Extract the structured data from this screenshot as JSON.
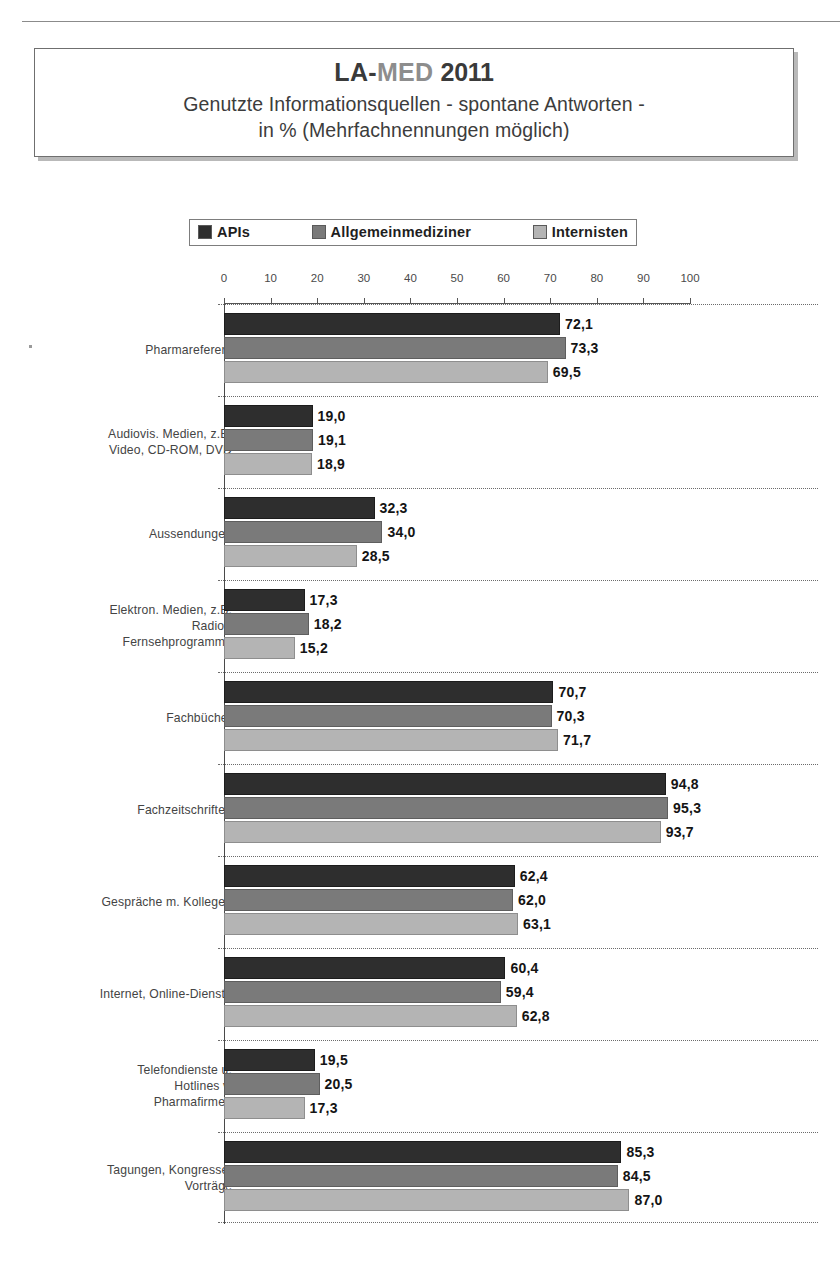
{
  "header": {
    "logo_la": "LA-",
    "logo_med": "MED",
    "logo_year": "2011",
    "title_line1": "Genutzte Informationsquellen - spontane Antworten -",
    "title_line2": "in % (Mehrfachnennungen möglich)"
  },
  "legend": {
    "items": [
      {
        "label": "APIs",
        "color": "#2e2e2e"
      },
      {
        "label": "Allgemeinmediziner",
        "color": "#7a7a7a"
      },
      {
        "label": "Internisten",
        "color": "#b4b4b4"
      }
    ]
  },
  "chart_data": {
    "type": "bar",
    "orientation": "horizontal",
    "title": "Genutzte Informationsquellen - spontane Antworten - in % (Mehrfachnennungen möglich)",
    "xlabel": "",
    "ylabel": "",
    "xlim": [
      0,
      100
    ],
    "xticks": [
      0,
      10,
      20,
      30,
      40,
      50,
      60,
      70,
      80,
      90,
      100
    ],
    "xtick_labels": [
      "0",
      "10",
      "20",
      "30",
      "40",
      "50",
      "60",
      "70",
      "80",
      "90",
      "100"
    ],
    "grid": false,
    "legend_position": "top",
    "decimal_separator": ",",
    "categories": [
      "Pharmareferent",
      "Audiovis. Medien, z.B.\nVideo, CD-ROM, DVD",
      "Aussendungen",
      "Elektron. Medien, z.B.\nRadio-/\nFernsehprogramme",
      "Fachbücher",
      "Fachzeitschriften",
      "Gespräche m. Kollegen",
      "Internet, Online-Dienste",
      "Telefondienste u.\nHotlines v.\nPharmafirmen",
      "Tagungen, Kongresse,\nVorträge"
    ],
    "series": [
      {
        "name": "APIs",
        "values": [
          72.1,
          19.0,
          32.3,
          17.3,
          70.7,
          94.8,
          62.4,
          60.4,
          19.5,
          85.3
        ]
      },
      {
        "name": "Allgemeinmediziner",
        "values": [
          73.3,
          19.1,
          34.0,
          18.2,
          70.3,
          95.3,
          62.0,
          59.4,
          20.5,
          84.5
        ]
      },
      {
        "name": "Internisten",
        "values": [
          69.5,
          18.9,
          28.5,
          15.2,
          71.7,
          93.7,
          63.1,
          62.8,
          17.3,
          87.0
        ]
      }
    ],
    "value_labels": [
      [
        "72,1",
        "73,3",
        "69,5"
      ],
      [
        "19,0",
        "19,1",
        "18,9"
      ],
      [
        "32,3",
        "34,0",
        "28,5"
      ],
      [
        "17,3",
        "18,2",
        "15,2"
      ],
      [
        "70,7",
        "70,3",
        "71,7"
      ],
      [
        "94,8",
        "95,3",
        "93,7"
      ],
      [
        "62,4",
        "62,0",
        "63,1"
      ],
      [
        "60,4",
        "59,4",
        "62,8"
      ],
      [
        "19,5",
        "20,5",
        "17,3"
      ],
      [
        "85,3",
        "84,5",
        "87,0"
      ]
    ]
  }
}
